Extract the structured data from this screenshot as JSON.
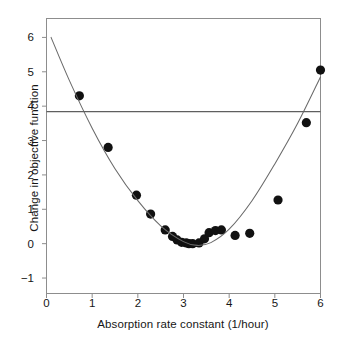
{
  "chart_data": {
    "type": "scatter",
    "title": "",
    "xlabel": "Absorption rate constant (1/hour)",
    "ylabel": "Change in objective function",
    "xlim": [
      0,
      6
    ],
    "ylim": [
      -1.45,
      6.55
    ],
    "xticks": [
      0,
      1,
      2,
      3,
      4,
      5,
      6
    ],
    "xtick_labels": [
      "0",
      "1",
      "2",
      "3",
      "4",
      "5",
      "6"
    ],
    "yticks": [
      -1,
      0,
      1,
      2,
      3,
      4,
      5,
      6
    ],
    "ytick_labels": [
      "−1",
      "0",
      "1",
      "2",
      "3",
      "4",
      "5",
      "6"
    ],
    "grid": false,
    "legend": null,
    "marker": {
      "shape": "circle",
      "color": "#111111",
      "size": 5.4
    },
    "series": [
      {
        "name": "observations",
        "type": "scatter",
        "x": [
          0.72,
          1.35,
          1.97,
          2.28,
          2.6,
          2.76,
          2.86,
          2.96,
          3.06,
          3.12,
          3.2,
          3.34,
          3.46,
          3.56,
          3.7,
          3.83,
          4.13,
          4.45,
          5.07,
          5.69,
          6.0
        ],
        "y": [
          4.3,
          2.8,
          1.41,
          0.86,
          0.4,
          0.21,
          0.11,
          0.04,
          0.02,
          0.0,
          0.0,
          0.02,
          0.14,
          0.32,
          0.38,
          0.4,
          0.24,
          0.3,
          1.27,
          3.52,
          5.05
        ]
      },
      {
        "name": "fitted-curve",
        "type": "line",
        "color": "#6a6a6a",
        "description": "quadratic fit through the observations",
        "x": [
          0.1,
          0.5,
          1.0,
          1.5,
          2.0,
          2.5,
          3.0,
          3.3,
          3.6,
          4.0,
          4.5,
          5.0,
          5.5,
          6.0
        ],
        "y": [
          6.0,
          4.75,
          3.36,
          2.18,
          1.25,
          0.52,
          0.06,
          -0.05,
          0.03,
          0.42,
          1.25,
          2.32,
          3.5,
          4.85
        ]
      },
      {
        "name": "reference-line",
        "type": "hline",
        "color": "#5f5f5f",
        "y": 3.84
      }
    ]
  }
}
